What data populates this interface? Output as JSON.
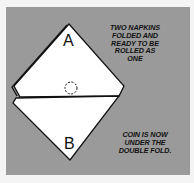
{
  "diagram": {
    "top_napkin_label": "A",
    "bottom_napkin_label": "B",
    "caption_top": "TWO NAPKINS\nFOLDED AND\nREADY TO BE\nROLLED AS\nONE",
    "caption_bottom": "COIN IS NOW\nUNDER THE\nDOUBLE FOLD.",
    "coin_marker": "dashed-circle",
    "colors": {
      "background": "#9a9a9a",
      "napkin": "#ffffff",
      "ink": "#111111"
    }
  }
}
